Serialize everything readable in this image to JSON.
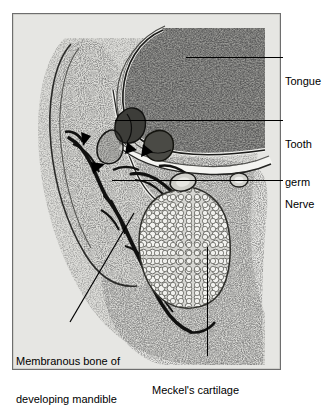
{
  "figure": {
    "type": "labeled-histology-micrograph",
    "panel": {
      "border_color": "#6e6e6e",
      "background_color": "#e3e3e1"
    },
    "label_color": "#000000",
    "leader_color": "#000000"
  },
  "labels": {
    "tongue": {
      "text": "Tongue",
      "lines": [
        "Tongue"
      ],
      "leader": {
        "orientation": "horizontal",
        "x1": 186,
        "x2": 283,
        "y": 57
      }
    },
    "tooth_germ": {
      "text": "Tooth germ",
      "lines": [
        "Tooth",
        "germ"
      ],
      "leader": {
        "orientation": "horizontal",
        "x1": 115,
        "x2": 283,
        "y": 120
      }
    },
    "nerve": {
      "text": "Nerve",
      "lines": [
        "Nerve"
      ],
      "leader": {
        "orientation": "horizontal",
        "x1": 112,
        "x2": 283,
        "y": 180
      }
    },
    "membranous_bone": {
      "text": "Membranous bone of developing mandible",
      "lines": [
        "Membranous bone of",
        "developing mandible"
      ],
      "leader": {
        "orientation": "diagonal",
        "x1": 134,
        "y1": 213,
        "x2": 70,
        "y2": 322
      }
    },
    "meckels_cartilage": {
      "text": "Meckel's cartilage",
      "lines": [
        "Meckel's cartilage"
      ],
      "leader": {
        "orientation": "vertical",
        "x": 207,
        "y1": 247,
        "y2": 356
      }
    }
  }
}
